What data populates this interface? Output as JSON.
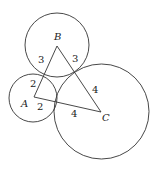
{
  "diagram": {
    "colors": {
      "stroke": "#333333",
      "text": "#222222",
      "background": "#ffffff"
    },
    "vertices": {
      "A": {
        "label": "A",
        "x": 34,
        "y": 97
      },
      "B": {
        "label": "B",
        "x": 57,
        "y": 46
      },
      "C": {
        "label": "C",
        "x": 101,
        "y": 112
      }
    },
    "circles": [
      {
        "center": "A",
        "r": 24
      },
      {
        "center": "B",
        "r": 32
      },
      {
        "center": "C",
        "r": 47.5
      }
    ],
    "edges": [
      {
        "from": "A",
        "to": "B"
      },
      {
        "from": "B",
        "to": "C"
      },
      {
        "from": "A",
        "to": "C"
      }
    ],
    "segment_labels": {
      "AB_near_B": "3",
      "BC_near_B": "3",
      "AB_near_A": "2",
      "AC_near_A": "2",
      "BC_near_C": "4",
      "AC_near_C": "4"
    },
    "vertex_labels": {
      "A": "A",
      "B": "B",
      "C": "C"
    }
  }
}
